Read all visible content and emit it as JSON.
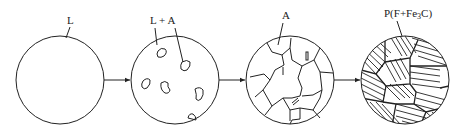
{
  "diagram": {
    "title": "",
    "stages": [
      {
        "id": "liquid",
        "label": "L"
      },
      {
        "id": "liquid-austenite",
        "label": "L + A"
      },
      {
        "id": "austenite",
        "label": "A"
      },
      {
        "id": "pearlite",
        "label": "P(F+Fe3C)",
        "label_parts": [
          "P(F+Fe",
          "3",
          "C)"
        ]
      }
    ],
    "arrows": [
      {
        "from": "liquid",
        "to": "liquid-austenite"
      },
      {
        "from": "liquid-austenite",
        "to": "austenite"
      },
      {
        "from": "austenite",
        "to": "pearlite"
      }
    ],
    "colors": {
      "line": "#222222",
      "background": "#ffffff"
    }
  }
}
